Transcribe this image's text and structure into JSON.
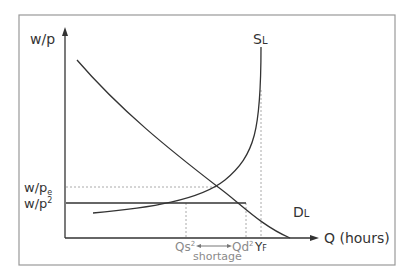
{
  "diagram": {
    "y_axis_label": "w/p",
    "x_axis_label": "Q (hours)",
    "curves": {
      "supply": {
        "label_main": "S",
        "label_sub": "L"
      },
      "demand": {
        "label_main": "D",
        "label_sub": "L"
      }
    },
    "y_ticks": {
      "equilibrium": {
        "main": "w/p",
        "sub": "e"
      },
      "below": {
        "main": "w/p",
        "sup": "2"
      }
    },
    "x_ticks": {
      "qs": {
        "main": "Qs",
        "sup": "2"
      },
      "qd": {
        "main": "Qd",
        "sup": "2"
      },
      "yf": {
        "main": "Y",
        "sub": "F"
      }
    },
    "annotation": "shortage",
    "colors": {
      "line": "#333333",
      "dashed": "#aaaaaa",
      "frame": "#999999",
      "grey_text": "#8a8a8a"
    }
  }
}
